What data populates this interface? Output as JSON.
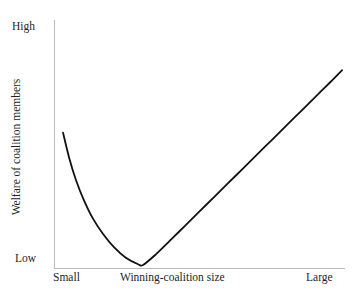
{
  "figure": {
    "background_color": "#ffffff",
    "axis_color": "#b9b9b9",
    "text_color": "#221f1f",
    "curve_color": "#111111"
  },
  "axes": {
    "y_title": "Welfare of coalition members",
    "y_high_label": "High",
    "y_low_label": "Low",
    "x_title": "Winning-coalition size",
    "x_small_label": "Small",
    "x_large_label": "Large"
  },
  "chart_data": {
    "type": "line",
    "title": "",
    "subtitle": "",
    "xlabel": "Winning-coalition size",
    "ylabel": "Welfare of coalition members",
    "xlim": [
      0,
      100
    ],
    "ylim": [
      0,
      100
    ],
    "grid": false,
    "legend": null,
    "legend_position": "none",
    "x_tick_labels": [
      "Small",
      "Large"
    ],
    "y_tick_labels": [
      "Low",
      "High"
    ],
    "annotations": [],
    "series": [
      {
        "name": "Welfare of coalition members",
        "color": "#111111",
        "shape": "j-curve",
        "description": "Convex decline from a high value at very small coalition size to a minimum at a moderate coalition size, then a near-linear rise to a high value at large coalition size.",
        "x": [
          3.1,
          5.2,
          7.6,
          10.3,
          13.4,
          16.8,
          20.6,
          24.7,
          28.9,
          30.6,
          35.0,
          40.0,
          45.0,
          50.0,
          55.0,
          60.0,
          65.0,
          70.0,
          75.0,
          80.0,
          85.0,
          90.0,
          95.0,
          99.0
        ],
        "y": [
          54.6,
          44.5,
          35.3,
          27.3,
          19.9,
          13.8,
          8.4,
          4.1,
          1.5,
          1.2,
          5.5,
          11.2,
          17.0,
          22.8,
          28.6,
          34.4,
          40.2,
          46.0,
          51.8,
          57.6,
          63.4,
          69.2,
          75.0,
          79.8
        ],
        "minimum": {
          "x": 30.6,
          "y": 1.2
        },
        "start_point": {
          "x": 3.1,
          "y": 54.6
        },
        "end_point": {
          "x": 99.0,
          "y": 79.8
        }
      }
    ]
  }
}
